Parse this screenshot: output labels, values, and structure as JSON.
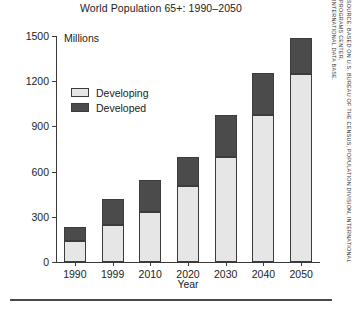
{
  "chart_data": {
    "type": "bar",
    "subtype": "stacked",
    "title": "World Population 65+: 1990–2050",
    "xlabel": "Year",
    "ylabel": "Millions",
    "units_label": "Millions",
    "categories": [
      "1990",
      "1999",
      "2010",
      "2020",
      "2030",
      "2040",
      "2050"
    ],
    "series": [
      {
        "name": "Developing",
        "color": "#e6e6e6",
        "values": [
          140,
          245,
          335,
          505,
          695,
          975,
          1245
        ]
      },
      {
        "name": "Developed",
        "color": "#4b4b4b",
        "values": [
          95,
          175,
          210,
          195,
          280,
          280,
          245
        ]
      }
    ],
    "totals": [
      235,
      420,
      545,
      700,
      975,
      1255,
      1490
    ],
    "ylim": [
      0,
      1500
    ],
    "yticks": [
      0,
      300,
      600,
      900,
      1200,
      1500
    ],
    "ytick_labels": [
      "0",
      "300",
      "600",
      "900",
      "1200",
      "1500"
    ],
    "grid": false,
    "legend_position": "upper-left-inside"
  },
  "legend": {
    "items": [
      {
        "label": "Developing",
        "swatch": "light-gray-swatch"
      },
      {
        "label": "Developed",
        "swatch": "dark-gray-swatch"
      }
    ]
  },
  "source": {
    "line1": "SOURCE: BASED ON U.S. BUREAU OF THE CENSUS, POPULATION DIVISION, INTERNATIONAL PROGRAMS CENTER,",
    "line2": "INTERNATIONAL DATA BASE."
  },
  "colors": {
    "developing": "#e6e6e6",
    "developed": "#4b4b4b",
    "axis": "#3a3a3a",
    "text": "#222222",
    "background": "#ffffff"
  }
}
